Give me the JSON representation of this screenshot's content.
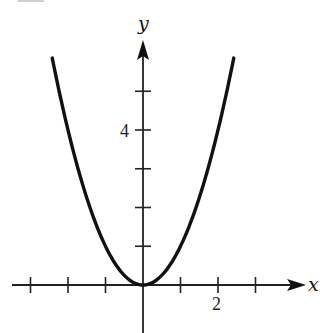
{
  "chart_data": {
    "type": "line",
    "title": "",
    "function": "y = x^2",
    "xlabel": "x",
    "ylabel": "y",
    "xlim": [
      -3,
      4.3
    ],
    "ylim": [
      -1.2,
      6.3
    ],
    "grid": false,
    "legend": null,
    "x_ticks": [
      -3,
      -2,
      -1,
      0,
      1,
      2,
      3
    ],
    "x_tick_labels": [
      {
        "value": 2,
        "label": "2"
      }
    ],
    "y_ticks": [
      1,
      2,
      3,
      4,
      5
    ],
    "y_tick_labels": [
      {
        "value": 4,
        "label": "4"
      }
    ],
    "series": [
      {
        "name": "y = x^2",
        "x": [
          -2.42,
          -2.0,
          -1.5,
          -1.0,
          -0.5,
          0,
          0.5,
          1.0,
          1.5,
          2.0,
          2.42
        ],
        "y": [
          5.86,
          4.0,
          2.25,
          1.0,
          0.25,
          0,
          0.25,
          1.0,
          2.25,
          4.0,
          5.86
        ]
      }
    ]
  },
  "labels": {
    "x_axis": "x",
    "y_axis": "y",
    "x_tick_2": "2",
    "y_tick_4": "4"
  },
  "colors": {
    "curve": "#111111",
    "axes": "#222222",
    "background": "#ffffff"
  }
}
